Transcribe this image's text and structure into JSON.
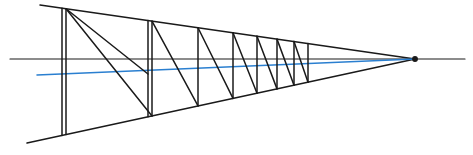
{
  "diagram": {
    "title": "",
    "type": "one-point perspective construction",
    "colors": {
      "line": "#1a1a1a",
      "guide": "#2a7fd0",
      "background": "#ffffff"
    },
    "vanishing_point": {
      "x": 415,
      "y": 59
    },
    "horizon": {
      "x1": 10,
      "x2": 465,
      "y": 59
    },
    "top_edge": {
      "x1": 40,
      "y1": 5
    },
    "bottom_edge": {
      "x1": 27,
      "y1": 143
    },
    "blue_guide": {
      "x1": 37,
      "y1": 75
    },
    "posts_double": [
      62,
      148
    ],
    "posts_single": [
      198,
      233,
      257,
      277,
      294,
      308
    ]
  }
}
